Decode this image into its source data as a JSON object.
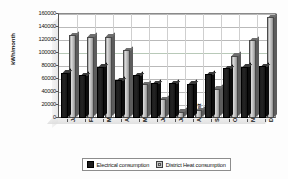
{
  "chart_data": {
    "type": "bar",
    "title": "",
    "xlabel": "",
    "ylabel": "kWh/month",
    "ylim": [
      0,
      160000
    ],
    "ytick_step": 20000,
    "yticks": [
      "160000",
      "140000",
      "120000",
      "100000",
      "80000",
      "60000",
      "40000",
      "20000",
      "0"
    ],
    "grid": true,
    "legend_position": "bottom",
    "categories": [
      "January",
      "February",
      "March",
      "April",
      "May",
      "June",
      "July",
      "August",
      "September",
      "October",
      "November",
      "December"
    ],
    "series": [
      {
        "name": "Electrical consumption",
        "color": "#1c1c1c",
        "values": [
          70000,
          66000,
          79000,
          58000,
          66000,
          54000,
          54000,
          53000,
          67000,
          77000,
          79000,
          80000
        ]
      },
      {
        "name": "District Heat consumption",
        "color": "#c4c4c4",
        "values": [
          127000,
          125000,
          125000,
          104000,
          52000,
          29000,
          10000,
          12000,
          45000,
          96000,
          120000,
          155000
        ]
      }
    ]
  },
  "legend": {
    "items": [
      {
        "label": "Electrical consumption",
        "swatch": "elec"
      },
      {
        "label": "District Heat consumption",
        "swatch": "heat"
      }
    ]
  }
}
